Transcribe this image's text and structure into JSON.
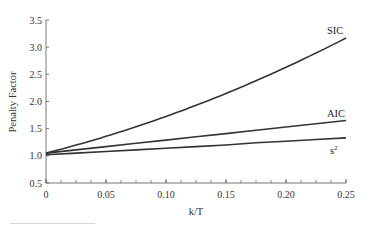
{
  "chart_data": {
    "type": "line",
    "title": "",
    "xlabel": "k/T",
    "ylabel": "Penalty Factor",
    "xlim": [
      0,
      0.25
    ],
    "ylim": [
      0.5,
      3.5
    ],
    "xticks": [
      0,
      0.05,
      0.1,
      0.15,
      0.2,
      0.25
    ],
    "xtick_labels": [
      "0",
      "0.05",
      "0.10",
      "0.15",
      "0.20",
      "0.25"
    ],
    "yticks": [
      0.5,
      1.0,
      1.5,
      2.0,
      2.5,
      3.0,
      3.5
    ],
    "ytick_labels": [
      "0.5",
      "1.0",
      "1.5",
      "2.0",
      "2.5",
      "3.0",
      "3.5"
    ],
    "grid": false,
    "legend": "inline labels at right end of lines",
    "x": [
      0,
      0.025,
      0.05,
      0.075,
      0.1,
      0.125,
      0.15,
      0.175,
      0.2,
      0.225,
      0.25
    ],
    "series": [
      {
        "name": "SIC",
        "values": [
          1.05,
          1.18,
          1.32,
          1.47,
          1.63,
          1.8,
          1.99,
          2.19,
          2.42,
          2.67,
          3.17
        ]
      },
      {
        "name": "AIC",
        "values": [
          1.05,
          1.11,
          1.17,
          1.23,
          1.29,
          1.35,
          1.41,
          1.47,
          1.53,
          1.59,
          1.65
        ]
      },
      {
        "name": "s²",
        "values": [
          1.02,
          1.05,
          1.08,
          1.11,
          1.14,
          1.17,
          1.2,
          1.24,
          1.27,
          1.3,
          1.33
        ]
      }
    ]
  },
  "labels": {
    "ylabel": "Penalty Factor",
    "xlabel": "k/T",
    "sic": "SIC",
    "aic": "AIC",
    "s2_base": "s",
    "s2_sup": "2"
  }
}
